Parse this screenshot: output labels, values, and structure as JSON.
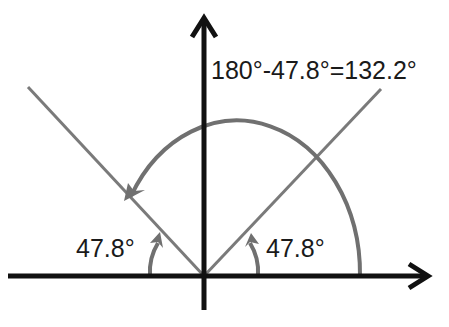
{
  "diagram": {
    "type": "angle-diagram",
    "colors": {
      "axes": "#111111",
      "lines": "#7a7a7a",
      "arcs": "#707070",
      "text": "#1a1a1a",
      "background": "#ffffff"
    },
    "labels": {
      "equation": "180°-47.8°=132.2°",
      "left_angle": "47.8°",
      "right_angle": "47.8°"
    },
    "angles_deg": {
      "incident": 47.8,
      "reflected": 47.8,
      "swept": 132.2
    }
  }
}
